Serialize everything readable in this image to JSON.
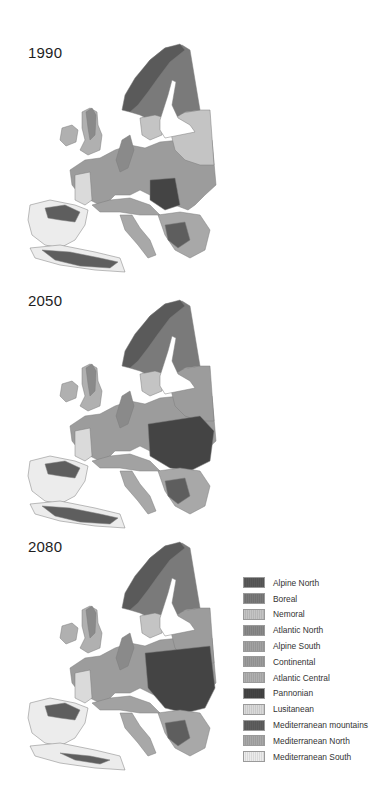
{
  "figure": {
    "panels": [
      {
        "year": "1990"
      },
      {
        "year": "2050"
      },
      {
        "year": "2080"
      }
    ],
    "legend": [
      {
        "label": "Alpine North",
        "color": "#5a5a5a"
      },
      {
        "label": "Boreal",
        "color": "#7a7a7a"
      },
      {
        "label": "Nemoral",
        "color": "#c4c4c4"
      },
      {
        "label": "Atlantic North",
        "color": "#8a8a8a"
      },
      {
        "label": "Alpine South",
        "color": "#a2a2a2"
      },
      {
        "label": "Continental",
        "color": "#9c9c9c"
      },
      {
        "label": "Atlantic Central",
        "color": "#b0b0b0"
      },
      {
        "label": "Pannonian",
        "color": "#444444"
      },
      {
        "label": "Lusitanean",
        "color": "#dadada"
      },
      {
        "label": "Mediterranean mountains",
        "color": "#5e5e5e"
      },
      {
        "label": "Mediterranean North",
        "color": "#a8a8a8"
      },
      {
        "label": "Mediterranean South",
        "color": "#ececec"
      }
    ]
  }
}
